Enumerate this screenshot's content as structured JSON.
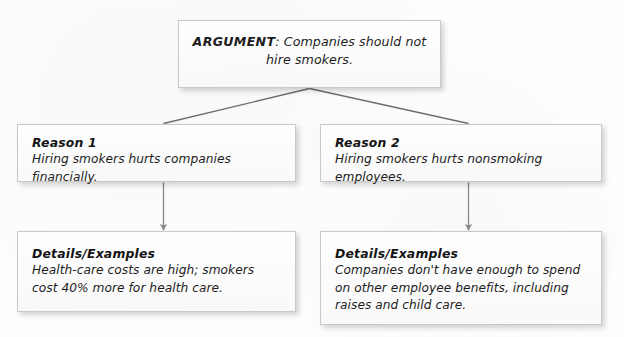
{
  "diagram": {
    "type": "argument-tree",
    "title_text": "Argument organizer",
    "root": {
      "label": "ARGUMENT:",
      "line1": "ARGUMENT: Companies should",
      "line2": "not hire smokers.",
      "claim_prefix": "ARGUMENT",
      "claim_separator": ":",
      "claim_text": "Companies should not hire smokers."
    },
    "branches": [
      {
        "id": "branch-1",
        "reason": {
          "heading": "Reason 1",
          "body": "Hiring smokers hurts companies financially."
        },
        "details": {
          "heading": "Details/Examples",
          "body": "Health-care costs are high; smokers cost 40% more for health care."
        }
      },
      {
        "id": "branch-2",
        "reason": {
          "heading": "Reason 2",
          "body": "Hiring smokers hurts nonsmoking employees."
        },
        "details": {
          "heading": "Details/Examples",
          "body": "Companies don't have enough to spend on other employee benefits, including raises and child care."
        }
      }
    ],
    "connectors": [
      {
        "name": "argument-to-reason-1",
        "style": "diagonal-line",
        "from": "argument",
        "to": "reason-1"
      },
      {
        "name": "argument-to-reason-2",
        "style": "diagonal-line",
        "from": "argument",
        "to": "reason-2"
      },
      {
        "name": "reason-1-to-details-1",
        "style": "down-arrow",
        "from": "reason-1",
        "to": "details-1"
      },
      {
        "name": "reason-2-to-details-2",
        "style": "down-arrow",
        "from": "reason-2",
        "to": "details-2"
      }
    ],
    "colors": {
      "page_background": "#fdfdfd",
      "box_fill": "#fbfbfb",
      "box_border": "#c9c9c9",
      "text": "#1d1d1d",
      "connector_line": "#6e6e6e",
      "arrow": "#8a8a8a",
      "shadow": "rgba(0,0,0,0.17)"
    }
  }
}
